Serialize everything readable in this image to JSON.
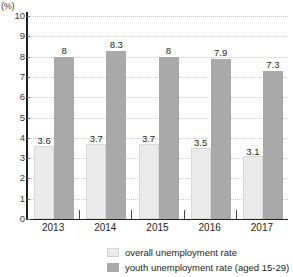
{
  "chart_data": {
    "type": "bar",
    "title": "",
    "xlabel": "",
    "ylabel": "(%)",
    "ylim": [
      0,
      10
    ],
    "ytick_labels": [
      "0",
      "1",
      "2",
      "3",
      "4",
      "5",
      "6",
      "7",
      "8",
      "9",
      "10"
    ],
    "grid": true,
    "legend_position": "bottom",
    "categories": [
      "2013",
      "2014",
      "2015",
      "2016",
      "2017"
    ],
    "series": [
      {
        "name": "overall unemployment rate",
        "color": "#ebebeb",
        "values": [
          3.6,
          3.7,
          3.7,
          3.5,
          3.1
        ],
        "labels": [
          "3.6",
          "3.7",
          "3.7",
          "3.5",
          "3.1"
        ]
      },
      {
        "name": "youth unemployment rate (aged 15-29)",
        "color": "#a9a9a9",
        "values": [
          8,
          8.3,
          8,
          7.9,
          7.3
        ],
        "labels": [
          "8",
          "8.3",
          "8",
          "7.9",
          "7.3"
        ]
      }
    ]
  },
  "axis": {
    "unit_label": "(%)"
  },
  "legend": {
    "items": [
      {
        "label": "overall unemployment rate",
        "swatch": "light-gray-swatch-icon"
      },
      {
        "label": "youth unemployment rate (aged 15-29)",
        "swatch": "dark-gray-swatch-icon"
      }
    ]
  }
}
